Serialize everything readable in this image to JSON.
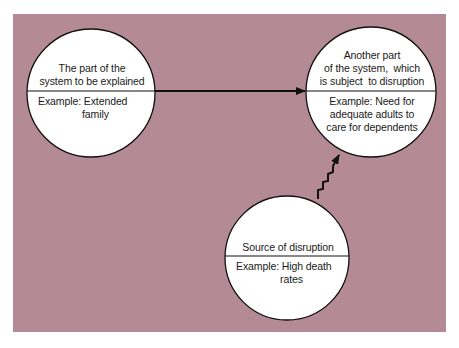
{
  "diagram": {
    "background_color": "#b38a95",
    "line_color": "#111111",
    "node_fill": "#ffffff",
    "nodes": [
      {
        "id": "explained",
        "top_label": "The part of the system to be explained",
        "top_lines": [
          "The part of the",
          "system to be explained"
        ],
        "bottom_lines": [
          "Example: Extended",
          "family"
        ]
      },
      {
        "id": "disrupted",
        "top_label": "Another part of the system, which is subject to disruption",
        "top_lines": [
          "Another part",
          "of the system,  which",
          "is subject  to disruption"
        ],
        "bottom_lines": [
          "Example: Need for",
          "adequate adults to",
          "care for dependents"
        ]
      },
      {
        "id": "source",
        "top_label": "Source of disruption",
        "top_lines": [
          "Source of disruption"
        ],
        "bottom_lines": [
          "Example: High death",
          "rates"
        ]
      }
    ],
    "edges": [
      {
        "from": "explained",
        "to": "disrupted",
        "style": "straight-arrow"
      },
      {
        "from": "source",
        "to": "disrupted",
        "style": "zigzag-arrow"
      }
    ]
  }
}
